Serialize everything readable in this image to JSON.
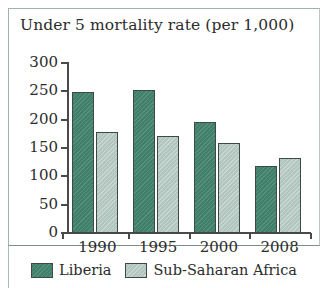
{
  "chart_data": {
    "type": "bar",
    "title": "Under 5 mortality rate (per 1,000)",
    "xlabel": "",
    "ylabel": "",
    "categories": [
      "1990",
      "1995",
      "2000",
      "2008"
    ],
    "series": [
      {
        "name": "Liberia",
        "color": "#40806a",
        "values": [
          248,
          253,
          196,
          118
        ]
      },
      {
        "name": "Sub-Saharan Africa",
        "color": "#b2c6bf",
        "values": [
          178,
          172,
          158,
          132
        ]
      }
    ],
    "ylim": [
      0,
      300
    ],
    "yticks": [
      0,
      50,
      100,
      150,
      200,
      250,
      300
    ],
    "ytick_labels": [
      "0",
      "50",
      "100",
      "150",
      "200",
      "250",
      "300"
    ],
    "grid": false,
    "legend_position": "bottom"
  },
  "frame": {
    "border_color": "#9fb3ad"
  }
}
